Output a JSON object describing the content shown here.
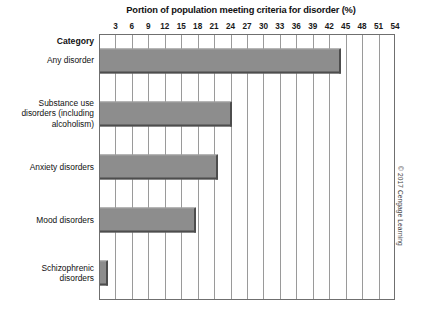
{
  "chart_data": {
    "type": "bar",
    "orientation": "horizontal",
    "title": "Portion of population meeting criteria for disorder (%)",
    "xlabel": "Portion of population meeting criteria for disorder (%)",
    "ylabel": "Category",
    "categories": [
      "Any disorder",
      "Substance use disorders (including alcoholism)",
      "Anxiety disorders",
      "Mood disorders",
      "Schizophrenic disorders"
    ],
    "values": [
      44,
      24,
      21.5,
      17.5,
      1.5
    ],
    "xlim": [
      0,
      54
    ],
    "xticks": [
      3,
      6,
      9,
      12,
      15,
      18,
      21,
      24,
      27,
      30,
      33,
      36,
      39,
      42,
      45,
      48,
      51,
      54
    ],
    "tick_step": 3,
    "grid": true,
    "legend": false,
    "bar_color": "#8d8d8d",
    "bar_edge_color": "#4d4d4d"
  },
  "axis": {
    "category_axis_title": "Category",
    "tick_labels": [
      "3",
      "6",
      "9",
      "12",
      "15",
      "18",
      "21",
      "24",
      "27",
      "30",
      "33",
      "36",
      "39",
      "42",
      "45",
      "48",
      "51",
      "54"
    ]
  },
  "categories": [
    {
      "lines": [
        "Any disorder"
      ]
    },
    {
      "lines": [
        "Substance use",
        "disorders (including",
        "alcoholism)"
      ]
    },
    {
      "lines": [
        "Anxiety disorders"
      ]
    },
    {
      "lines": [
        "Mood disorders"
      ]
    },
    {
      "lines": [
        "Schizophrenic",
        "disorders"
      ]
    }
  ],
  "credit": "© 2017 Cengage Learning"
}
